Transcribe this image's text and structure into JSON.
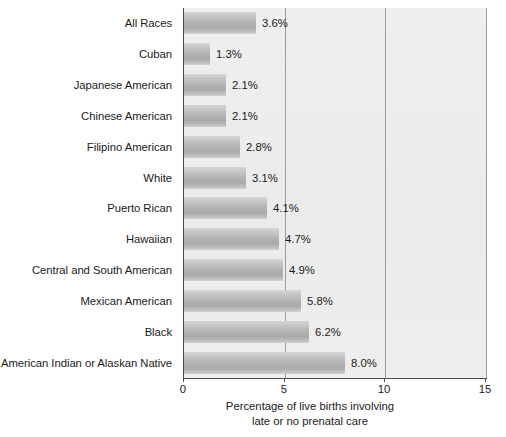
{
  "chart_data": {
    "type": "bar",
    "orientation": "horizontal",
    "title": "",
    "subtitle": "",
    "xlabel_line1": "Percentage of live births involving",
    "xlabel_line2": "late or no prenatal care",
    "ylabel": "",
    "xlim": [
      0,
      15
    ],
    "xticks": [
      0,
      5,
      10,
      15
    ],
    "xtick_labels": [
      "0",
      "5",
      "10",
      "15"
    ],
    "grid": true,
    "grid_axis": "x",
    "legend": false,
    "plot_background": "#ededed",
    "bar_color": "#b2b2b2",
    "categories": [
      "All Races",
      "Cuban",
      "Japanese American",
      "Chinese American",
      "Filipino American",
      "White",
      "Puerto Rican",
      "Hawaiian",
      "Central and South American",
      "Mexican American",
      "Black",
      "American Indian or Alaskan Native"
    ],
    "values": [
      3.6,
      1.3,
      2.1,
      2.1,
      2.8,
      3.1,
      4.1,
      4.7,
      4.9,
      5.8,
      6.2,
      8.0
    ],
    "value_labels": [
      "3.6%",
      "1.3%",
      "2.1%",
      "2.1%",
      "2.8%",
      "3.1%",
      "4.1%",
      "4.7%",
      "4.9%",
      "5.8%",
      "6.2%",
      "8.0%"
    ]
  }
}
